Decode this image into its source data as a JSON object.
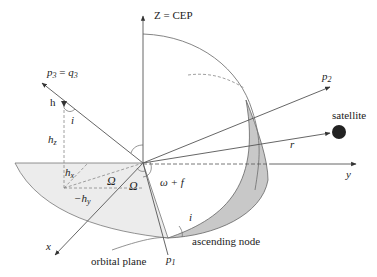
{
  "diagram": {
    "labels": {
      "z_axis": "Z = CEP",
      "p3": "p",
      "p3_sub": "3",
      "q3": "q",
      "q3_sub": "3",
      "p3_eq": " = ",
      "p2": "p",
      "p2_sub": "2",
      "p1": "p",
      "p1_sub": "1",
      "h": "h",
      "i_top": "i",
      "hz": "h",
      "hz_sub": "z",
      "hx": "h",
      "hx_sub": "x",
      "neg_hy": "−h",
      "neg_hy_sub": "y",
      "omega_cap_1": "Ω",
      "omega_cap_2": "Ω",
      "omega_f": "ω + f",
      "satellite": "satellite",
      "r": "r",
      "y_axis": "y",
      "x_axis": "x",
      "i_bottom": "i",
      "ascending_node": "ascending node",
      "orbital_plane": "orbital plane"
    },
    "colors": {
      "line": "#555555",
      "orbital_plane_fill": "#ececec",
      "crescent_fill": "#c8c8c8",
      "satellite": "#222222",
      "text": "#222222"
    }
  }
}
